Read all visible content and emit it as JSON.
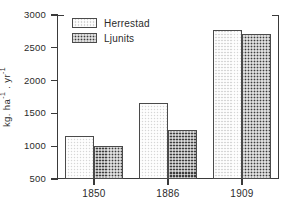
{
  "chart_data": {
    "type": "bar",
    "title": "",
    "subtitle": "",
    "xlabel": "",
    "ylabel": "kg. ha-1 . yr-1",
    "ylabel_parts": {
      "prefix": "kg. ha",
      "exp1": "-1",
      "middle": " . yr",
      "exp2": "-1"
    },
    "categories": [
      "1850",
      "1886",
      "1909"
    ],
    "series": [
      {
        "name": "Herrestad",
        "values": [
          1150,
          1660,
          2770
        ],
        "color": "#d6d6d6",
        "pattern": "light-checker"
      },
      {
        "name": "Ljunits",
        "values": [
          1010,
          1250,
          2710
        ],
        "color": "#3d3d3d",
        "pattern": "dark-checker"
      }
    ],
    "ylim": [
      500,
      3000
    ],
    "ytick_labels": [
      "3000",
      "2500",
      "2000",
      "1500",
      "1000",
      "500"
    ],
    "ytick_values": [
      3000,
      2500,
      2000,
      1500,
      1000,
      500
    ],
    "xtick_labels": [
      "1850",
      "1886",
      "1909"
    ],
    "grid": false,
    "legend_position": "top-left",
    "axis_color": "#3a3a3a"
  },
  "legend": {
    "entries": [
      {
        "label": "Herrestad"
      },
      {
        "label": "Ljunits"
      }
    ]
  }
}
